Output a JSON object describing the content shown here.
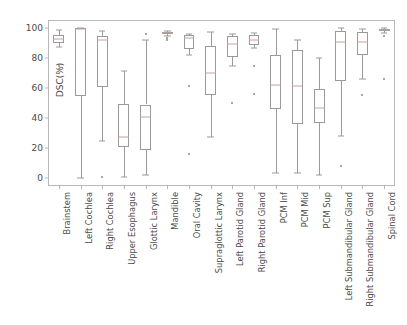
{
  "chart_data": {
    "type": "box",
    "title": "",
    "xlabel": "",
    "ylabel": "DSC(%)",
    "ylim": [
      -5,
      105
    ],
    "yticks": [
      0,
      20,
      40,
      60,
      80,
      100
    ],
    "ytick_labels": [
      "0",
      "20",
      "40",
      "60",
      "80",
      "100"
    ],
    "grid": false,
    "legend": "none",
    "categories": [
      "Brainstem",
      "Left Cochlea",
      "Right Cochlea",
      "Upper Esophagus",
      "Glottic Larynx",
      "Mandible",
      "Oral Cavity",
      "Supraglottic Larynx",
      "Left Parotid Gland",
      "Right Parotid Gland",
      "PCM Inf",
      "PCM Mid",
      "PCM Sup",
      "Left Submandibular Gland",
      "Right Submandibular Gland",
      "Spinal Cord"
    ],
    "boxes": [
      {
        "category": "Brainstem",
        "whisker_low": 87.0,
        "q1": 89.5,
        "median": 92.5,
        "q3": 95.0,
        "whisker_high": 98.5,
        "fliers": [
          74.5,
          72.5
        ]
      },
      {
        "category": "Left Cochlea",
        "whisker_low": 0.5,
        "q1": 54.5,
        "median": 99.0,
        "q3": 100.0,
        "whisker_high": 100.0,
        "fliers": []
      },
      {
        "category": "Right Cochlea",
        "whisker_low": 25.0,
        "q1": 60.5,
        "median": 92.0,
        "q3": 94.5,
        "whisker_high": 98.0,
        "fliers": [
          1.0
        ]
      },
      {
        "category": "Upper Esophagus",
        "whisker_low": 1.0,
        "q1": 21.0,
        "median": 27.5,
        "q3": 49.5,
        "whisker_high": 71.5,
        "fliers": []
      },
      {
        "category": "Glottic Larynx",
        "whisker_low": 2.0,
        "q1": 19.0,
        "median": 41.0,
        "q3": 49.0,
        "whisker_high": 91.5,
        "fliers": [
          96.0
        ]
      },
      {
        "category": "Mandible",
        "whisker_low": 94.5,
        "q1": 95.5,
        "median": 96.5,
        "q3": 97.0,
        "whisker_high": 98.0,
        "fliers": [
          93.0,
          92.0
        ]
      },
      {
        "category": "Oral Cavity",
        "whisker_low": 82.0,
        "q1": 86.0,
        "median": 93.0,
        "q3": 95.0,
        "whisker_high": 96.0,
        "fliers": [
          61.0,
          16.5
        ]
      },
      {
        "category": "Supraglottic Larynx",
        "whisker_low": 27.5,
        "q1": 55.0,
        "median": 70.0,
        "q3": 88.0,
        "whisker_high": 97.0,
        "fliers": []
      },
      {
        "category": "Left Parotid Gland",
        "whisker_low": 74.5,
        "q1": 80.5,
        "median": 89.0,
        "q3": 94.5,
        "whisker_high": 96.0,
        "fliers": [
          50.0
        ]
      },
      {
        "category": "Right Parotid Gland",
        "whisker_low": 86.5,
        "q1": 88.5,
        "median": 92.0,
        "q3": 95.0,
        "whisker_high": 96.5,
        "fliers": [
          74.5,
          56.0
        ]
      },
      {
        "category": "PCM Inf",
        "whisker_low": 3.5,
        "q1": 46.0,
        "median": 62.0,
        "q3": 82.0,
        "whisker_high": 99.0,
        "fliers": []
      },
      {
        "category": "PCM Mid",
        "whisker_low": 3.5,
        "q1": 36.0,
        "median": 61.0,
        "q3": 85.0,
        "whisker_high": 91.5,
        "fliers": []
      },
      {
        "category": "PCM Sup",
        "whisker_low": 2.0,
        "q1": 36.5,
        "median": 47.0,
        "q3": 59.5,
        "whisker_high": 79.5,
        "fliers": []
      },
      {
        "category": "Left Submandibular Gland",
        "whisker_low": 28.0,
        "q1": 64.5,
        "median": 90.5,
        "q3": 97.5,
        "whisker_high": 99.5,
        "fliers": [
          8.5
        ]
      },
      {
        "category": "Right Submandibular Gland",
        "whisker_low": 66.0,
        "q1": 81.5,
        "median": 90.5,
        "q3": 97.0,
        "whisker_high": 99.0,
        "fliers": [
          55.5
        ]
      },
      {
        "category": "Spinal Cord",
        "whisker_low": 96.5,
        "q1": 97.5,
        "median": 98.5,
        "q3": 99.0,
        "whisker_high": 99.5,
        "fliers": [
          94.5,
          66.0
        ]
      }
    ],
    "colors": {
      "box_edge": "#9a9a9a",
      "median": "#c8a0a0",
      "whisker": "#9a9a9a",
      "flier": "#8a8a8a",
      "axis": "#b9b9b9",
      "tick_text": "#4a4a4a",
      "background": "#ffffff"
    }
  }
}
